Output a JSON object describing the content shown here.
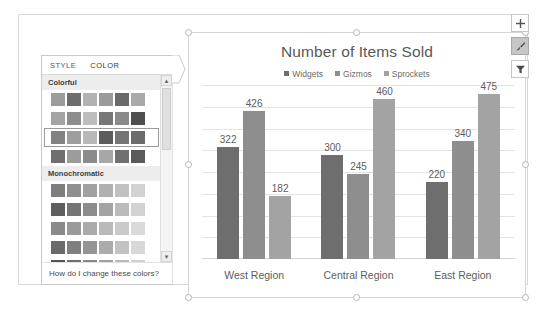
{
  "chart": {
    "title": "Number of Items Sold",
    "selected": true
  },
  "chart_data": {
    "type": "bar",
    "title": "Number of Items Sold",
    "xlabel": "",
    "ylabel": "",
    "ylim": [
      0,
      500
    ],
    "grid": true,
    "legend_position": "top",
    "data_labels": true,
    "categories": [
      "West Region",
      "Central Region",
      "East Region"
    ],
    "series": [
      {
        "name": "Widgets",
        "color": "#6e6e6e",
        "values": [
          322,
          300,
          220
        ]
      },
      {
        "name": "Gizmos",
        "color": "#8e8e8e",
        "values": [
          426,
          245,
          340
        ]
      },
      {
        "name": "Sprockets",
        "color": "#a3a3a3",
        "values": [
          182,
          460,
          475
        ]
      }
    ]
  },
  "format_pane": {
    "tabs": [
      {
        "label": "STYLE",
        "active": false
      },
      {
        "label": "COLOR",
        "active": true
      }
    ],
    "groups": [
      {
        "header": "Colorful",
        "rows": [
          {
            "selected": false,
            "colors": [
              "#9b9b9b",
              "#6d6d6d",
              "#b2b2b2",
              "#9a9a9a",
              "#6a6a6a",
              "#a9a9a9"
            ]
          },
          {
            "selected": false,
            "colors": [
              "#a4a4a4",
              "#8d8d8d",
              "#bdbdbd",
              "#777777",
              "#8a8a8a",
              "#4f4f4f"
            ]
          },
          {
            "selected": true,
            "colors": [
              "#828282",
              "#9e9e9e",
              "#b8b8b8",
              "#5c5c5c",
              "#757575",
              "#6b6b6b"
            ]
          },
          {
            "selected": false,
            "colors": [
              "#6f6f6f",
              "#9c9c9c",
              "#8b8b8b",
              "#a7a7a7",
              "#707070",
              "#5a5a5a"
            ]
          }
        ]
      },
      {
        "header": "Monochromatic",
        "rows": [
          {
            "selected": false,
            "colors": [
              "#7d7d7d",
              "#8f8f8f",
              "#a0a0a0",
              "#b0b0b0",
              "#c1c1c1",
              "#d2d2d2"
            ]
          },
          {
            "selected": false,
            "colors": [
              "#5e5e5e",
              "#757575",
              "#8c8c8c",
              "#a3a3a3",
              "#bbbbbb",
              "#d2d2d2"
            ]
          },
          {
            "selected": false,
            "colors": [
              "#8a8a8a",
              "#9a9a9a",
              "#aaaaaa",
              "#bababa",
              "#cacaca",
              "#dadada"
            ]
          },
          {
            "selected": false,
            "colors": [
              "#6a6a6a",
              "#7f7f7f",
              "#959595",
              "#ababab",
              "#c2c2c2",
              "#d8d8d8"
            ]
          },
          {
            "selected": false,
            "colors": [
              "#555555",
              "#6e6e6e",
              "#878787",
              "#a0a0a0",
              "#b9b9b9",
              "#d2d2d2"
            ]
          },
          {
            "selected": false,
            "colors": [
              "#4a4a4a",
              "#646464",
              "#7e7e7e",
              "#999999",
              "#b3b3b3",
              "#cecece"
            ]
          }
        ]
      }
    ],
    "help_link": "How do I change these colors?",
    "scrollbar": {
      "up_glyph": "▲",
      "down_glyph": "▼"
    }
  },
  "side_buttons": [
    {
      "name": "chart-elements-button",
      "icon": "plus-icon",
      "active": false
    },
    {
      "name": "chart-styles-button",
      "icon": "brush-icon",
      "active": true
    },
    {
      "name": "chart-filters-button",
      "icon": "funnel-icon",
      "active": false
    }
  ]
}
